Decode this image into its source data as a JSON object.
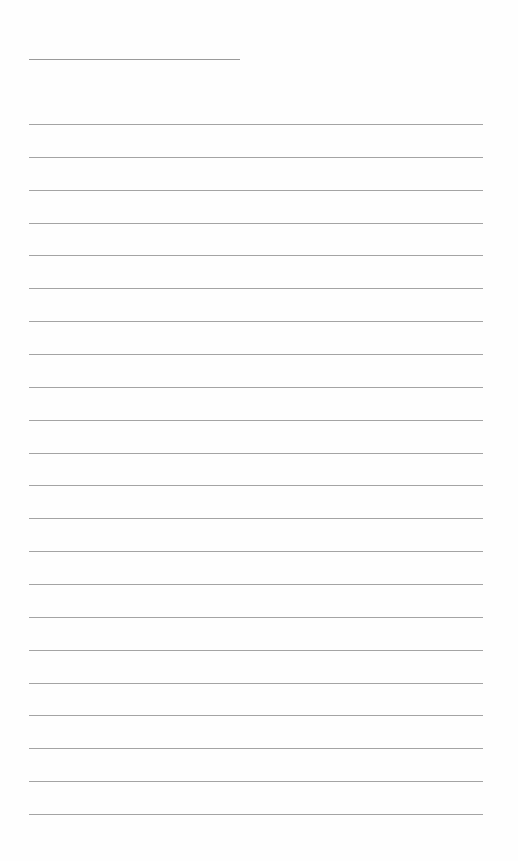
{
  "document": {
    "type": "lined-paper",
    "title_line": {
      "x": 29,
      "y": 59,
      "width": 211
    },
    "rules": {
      "count": 22,
      "start_y": 124,
      "spacing": 32.86,
      "x": 29,
      "width": 454
    },
    "line_color": "#a4a4a4",
    "background": "#fefefe"
  }
}
